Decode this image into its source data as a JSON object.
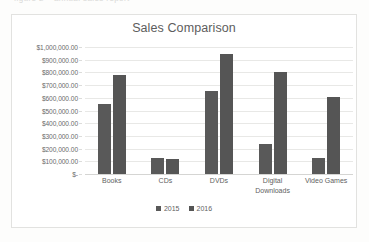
{
  "scan": {
    "top_cutoff_text": "figure 2 – annual sales report"
  },
  "chart_data": {
    "type": "bar",
    "title": "Sales Comparison",
    "xlabel": "",
    "ylabel": "",
    "categories": [
      "Books",
      "CDs",
      "DVDs",
      "Digital Downloads",
      "Video Games"
    ],
    "series": [
      {
        "name": "2015",
        "values": [
          550000,
          125000,
          650000,
          235000,
          130000
        ],
        "color": "#595959"
      },
      {
        "name": "2016",
        "values": [
          780000,
          115000,
          945000,
          805000,
          605000
        ],
        "color": "#555555"
      }
    ],
    "ylim": [
      0,
      1000000
    ],
    "ytick_step": 100000,
    "ytick_labels": [
      "$1,000,000.00",
      "$900,000.00",
      "$800,000.00",
      "$700,000.00",
      "$600,000.00",
      "$500,000.00",
      "$400,000.00",
      "$300,000.00",
      "$200,000.00",
      "$100,000.00",
      "$-"
    ],
    "grid": true,
    "legend_position": "bottom"
  }
}
